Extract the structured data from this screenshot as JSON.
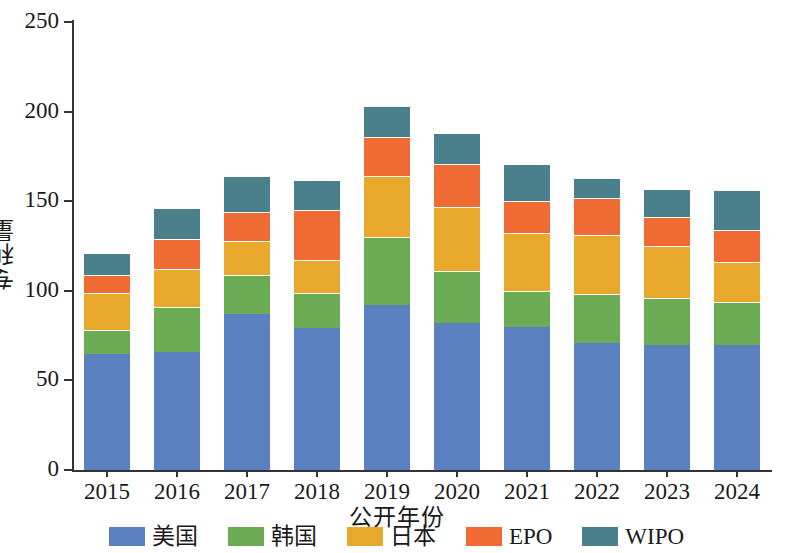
{
  "chart_data": {
    "type": "bar",
    "stacked": true,
    "title": "",
    "xlabel": "公开年份",
    "ylabel": "专利量",
    "ylim": [
      0,
      250
    ],
    "yticks": [
      0,
      50,
      100,
      150,
      200,
      250
    ],
    "grid": false,
    "legend_position": "bottom",
    "categories": [
      "2015",
      "2016",
      "2017",
      "2018",
      "2019",
      "2020",
      "2021",
      "2022",
      "2023",
      "2024"
    ],
    "series": [
      {
        "name": "美国",
        "color": "#5b80bf",
        "values": [
          65,
          66,
          87,
          79,
          92,
          82,
          80,
          71,
          70,
          70
        ]
      },
      {
        "name": "韩国",
        "color": "#6aab54",
        "values": [
          13,
          25,
          22,
          20,
          38,
          29,
          20,
          27,
          26,
          24
        ]
      },
      {
        "name": "日本",
        "color": "#e8a82b",
        "values": [
          21,
          21,
          19,
          18,
          34,
          36,
          32,
          33,
          29,
          22
        ]
      },
      {
        "name": "EPO",
        "color": "#ef6b33",
        "values": [
          10,
          17,
          16,
          28,
          22,
          24,
          18,
          21,
          16,
          18
        ]
      },
      {
        "name": "WIPO",
        "color": "#4a7f8c",
        "values": [
          12,
          17,
          20,
          17,
          17,
          17,
          21,
          11,
          16,
          22
        ]
      }
    ],
    "totals": [
      121,
      146,
      164,
      162,
      203,
      188,
      171,
      163,
      157,
      156
    ]
  }
}
